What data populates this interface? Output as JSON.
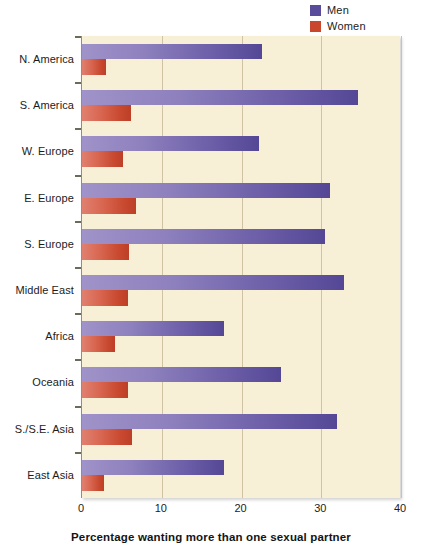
{
  "legend": {
    "position": "top-right",
    "items": [
      {
        "label": "Men",
        "color": "#594c9a",
        "swatch_name": "legend-swatch-men"
      },
      {
        "label": "Women",
        "color": "#c9472d",
        "swatch_name": "legend-swatch-women"
      }
    ]
  },
  "axis": {
    "x_title": "Percentage wanting more than one sexual partner",
    "x_ticks": [
      "0",
      "10",
      "20",
      "30",
      "40"
    ]
  },
  "colors": {
    "plot_background": "#f7efd6",
    "gridline": "#cfc3a4",
    "axis_line": "#8d8aa0",
    "men_light": "#a093c9",
    "men_dark": "#544795",
    "women_light": "#e08070",
    "women_dark": "#bd3f27"
  },
  "chart_data": {
    "type": "bar",
    "orientation": "horizontal",
    "title": "",
    "xlabel": "Percentage wanting more than one sexual partner",
    "ylabel": "",
    "xlim": [
      0,
      40
    ],
    "xticks": [
      0,
      10,
      20,
      30,
      40
    ],
    "grid": true,
    "legend_position": "top-right",
    "categories": [
      "N. America",
      "S. America",
      "W. Europe",
      "E. Europe",
      "S. Europe",
      "Middle East",
      "Africa",
      "Oceania",
      "S./S.E. Asia",
      "East Asia"
    ],
    "series": [
      {
        "name": "Men",
        "color": "#594c9a",
        "values": [
          22.6,
          34.6,
          22.2,
          31.1,
          30.5,
          32.8,
          17.8,
          25.0,
          32.0,
          17.8
        ]
      },
      {
        "name": "Women",
        "color": "#c9472d",
        "values": [
          3.0,
          6.1,
          5.1,
          6.8,
          5.9,
          5.8,
          4.1,
          5.8,
          6.3,
          2.8
        ]
      }
    ]
  }
}
